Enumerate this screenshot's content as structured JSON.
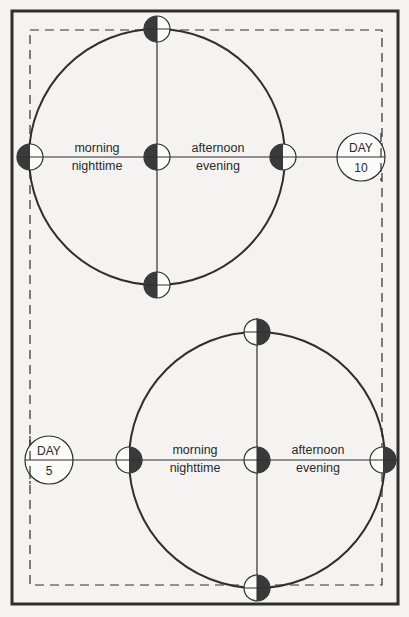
{
  "header": {
    "title": ""
  },
  "colors": {
    "line": "#2f2f2f",
    "fill_dark": "#3a3a3a",
    "background": "#f4f3f1"
  },
  "diagrams": [
    {
      "id": "day-10",
      "day_label": "DAY",
      "day_number": "10",
      "left_label_top": "morning",
      "left_label_bottom": "nighttime",
      "right_label_top": "afternoon",
      "right_label_bottom": "evening",
      "markers": {
        "top": "left-half-dark",
        "left": "left-half-dark",
        "center": "left-half-dark",
        "right": "left-half-dark",
        "bottom": "left-half-dark"
      }
    },
    {
      "id": "day-5",
      "day_label": "DAY",
      "day_number": "5",
      "left_label_top": "morning",
      "left_label_bottom": "nighttime",
      "right_label_top": "afternoon",
      "right_label_bottom": "evening",
      "markers": {
        "top": "right-half-dark",
        "left": "right-half-dark",
        "center": "right-half-dark",
        "right": "right-half-dark",
        "bottom": "right-half-dark"
      }
    }
  ]
}
